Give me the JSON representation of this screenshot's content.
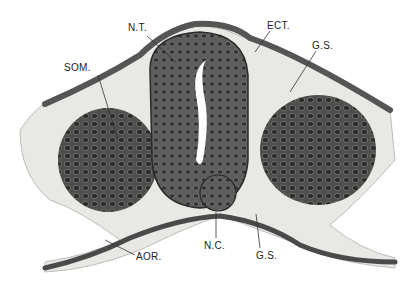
{
  "figure": {
    "type": "histology illustration",
    "labels": [
      {
        "text": "N.T.",
        "x": 128,
        "y": 27,
        "meaning": "neural tube"
      },
      {
        "text": "ECT.",
        "x": 267,
        "y": 24,
        "meaning": "ectoderm"
      },
      {
        "text": "G.S.",
        "x": 315,
        "y": 44,
        "meaning": "ground substance"
      },
      {
        "text": "SOM.",
        "x": 64,
        "y": 65,
        "meaning": "somite"
      },
      {
        "text": "N.C.",
        "x": 206,
        "y": 244,
        "meaning": "notochord"
      },
      {
        "text": "G.S.",
        "x": 257,
        "y": 255,
        "meaning": "ground substance"
      },
      {
        "text": "AOR.",
        "x": 137,
        "y": 255,
        "meaning": "aorta"
      }
    ],
    "colors": {
      "background": "#ffffff",
      "tissue_light": "#e6e6e2",
      "tissue_dark": "#3a3a3a",
      "cell": "#5a5a58"
    }
  }
}
